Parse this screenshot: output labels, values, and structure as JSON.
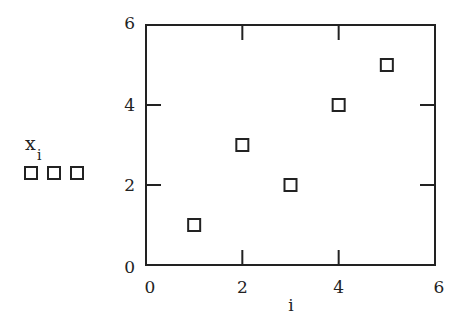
{
  "chart_data": {
    "type": "scatter",
    "title": "",
    "xlabel": "i",
    "ylabel": "x_i",
    "ylabel_main": "x",
    "ylabel_sub": "i",
    "xlim": [
      0,
      6
    ],
    "ylim": [
      0,
      6
    ],
    "xticks": [
      0,
      2,
      4,
      6
    ],
    "yticks": [
      0,
      2,
      4,
      6
    ],
    "xtick_labels": [
      "0",
      "2",
      "4",
      "6"
    ],
    "ytick_labels": [
      "0",
      "2",
      "4",
      "6"
    ],
    "grid": false,
    "marker": "open-square",
    "series": [
      {
        "name": "x_i",
        "x": [
          1,
          2,
          3,
          4,
          5
        ],
        "y": [
          1,
          3,
          2,
          4,
          5
        ]
      }
    ],
    "legend": {
      "position": "left",
      "marker_count": 3
    },
    "colors": {
      "axis": "#222222",
      "marker": "#222222",
      "background": "#ffffff"
    }
  }
}
